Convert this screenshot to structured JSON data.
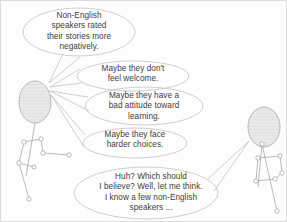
{
  "diagram": {
    "background_color": "#fdfdfd",
    "border_color": "#dcdcdc",
    "outline_color": "#b9bfc6",
    "text_color": "#3d3d3d",
    "head_fill_color": "#e6e6e6",
    "figure_line_color": "#9aa0a6"
  },
  "bubbles": [
    {
      "id": "finding",
      "name": "finding-bubble",
      "speaker": "left-figure",
      "text": "Non-English\nspeakers rated\ntheir stories more\nnegatively."
    },
    {
      "id": "welcome",
      "name": "welcome-bubble",
      "speaker": "left-figure",
      "text": "Maybe they don't\nfeel welcome."
    },
    {
      "id": "attitude",
      "name": "attitude-bubble",
      "speaker": "left-figure",
      "text": "Maybe they have a\nbad attitude toward\nlearning."
    },
    {
      "id": "choices",
      "name": "choices-bubble",
      "speaker": "left-figure",
      "text": "Maybe they face\nharder choices."
    },
    {
      "id": "think",
      "name": "thinking-bubble",
      "speaker": "right-figure",
      "text": "Huh? Which should\nI believe? Well, let me think.\nI know a few non-English\nspeakers ..."
    }
  ],
  "figures": [
    {
      "id": "left",
      "name": "left-stick-figure",
      "role": "speaker"
    },
    {
      "id": "right",
      "name": "right-stick-figure",
      "role": "listener"
    }
  ]
}
